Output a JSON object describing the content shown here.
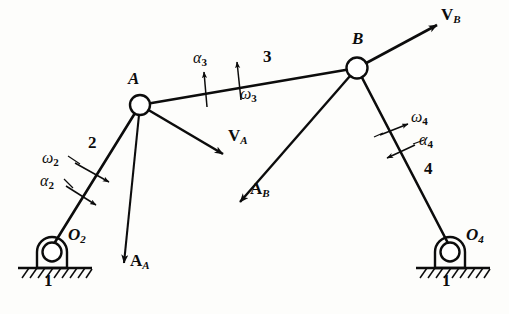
{
  "figure": {
    "type": "four-bar-linkage-kinematic-diagram",
    "background_color": "#fdfdfb",
    "ink_color": "#0c0c0c",
    "width": 509,
    "height": 314
  },
  "joints": [
    {
      "id": "A",
      "label": "A",
      "x": 140,
      "y": 105,
      "kind": "pin-joint",
      "label_x": 128,
      "label_y": 78
    },
    {
      "id": "B",
      "label": "B",
      "x": 357,
      "y": 68,
      "kind": "pin-joint",
      "label_x": 352,
      "label_y": 38
    },
    {
      "id": "O2",
      "label": "O",
      "sub": "2",
      "x": 52,
      "y": 253,
      "kind": "ground-pivot",
      "label_x": 68,
      "label_y": 234
    },
    {
      "id": "O4",
      "label": "O",
      "sub": "4",
      "x": 450,
      "y": 253,
      "kind": "ground-pivot",
      "label_x": 466,
      "label_y": 234
    }
  ],
  "links": [
    {
      "id": "link1-left",
      "number": "1",
      "label_x": 46,
      "label_y": 278,
      "role": "ground-frame"
    },
    {
      "id": "link1-right",
      "number": "1",
      "label_x": 444,
      "label_y": 278,
      "role": "ground-frame"
    },
    {
      "id": "link2",
      "number": "2",
      "label_x": 88,
      "label_y": 142,
      "role": "crank",
      "from": "O2",
      "to": "A"
    },
    {
      "id": "link3",
      "number": "3",
      "label_x": 263,
      "label_y": 57,
      "role": "coupler",
      "from": "A",
      "to": "B"
    },
    {
      "id": "link4",
      "number": "4",
      "label_x": 424,
      "label_y": 168,
      "role": "rocker",
      "from": "O4",
      "to": "B"
    }
  ],
  "vectors": [
    {
      "id": "VA",
      "symbol": "V",
      "sub": "A",
      "from_joint": "A",
      "x1": 140,
      "y1": 105,
      "x2": 223,
      "y2": 154,
      "label_x": 228,
      "label_y": 135,
      "quantity": "velocity"
    },
    {
      "id": "VB",
      "symbol": "V",
      "sub": "B",
      "from_joint": "B",
      "x1": 357,
      "y1": 68,
      "x2": 437,
      "y2": 25,
      "label_x": 441,
      "label_y": 13,
      "quantity": "velocity"
    },
    {
      "id": "AA",
      "symbol": "A",
      "sub": "A",
      "from_joint": "A",
      "x1": 140,
      "y1": 105,
      "x2": 124,
      "y2": 263,
      "label_x": 128,
      "label_y": 257,
      "quantity": "acceleration"
    },
    {
      "id": "AB",
      "symbol": "A",
      "sub": "B",
      "from_joint": "B",
      "x1": 357,
      "y1": 68,
      "x2": 240,
      "y2": 202,
      "label_x": 250,
      "label_y": 187,
      "quantity": "acceleration"
    }
  ],
  "kinematic_symbols": [
    {
      "id": "omega2",
      "symbol": "ω",
      "sub": "2",
      "label_x": 46,
      "label_y": 159,
      "quantity": "angular-velocity",
      "link": "2",
      "arrow_sense": "down-right"
    },
    {
      "id": "alpha2",
      "symbol": "α",
      "sub": "2",
      "label_x": 42,
      "label_y": 182,
      "quantity": "angular-acceleration",
      "link": "2",
      "arrow_sense": "down-right"
    },
    {
      "id": "alpha3",
      "symbol": "α",
      "sub": "3",
      "label_x": 196,
      "label_y": 58,
      "quantity": "angular-acceleration",
      "link": "3",
      "arrow_sense": "up"
    },
    {
      "id": "omega3",
      "symbol": "ω",
      "sub": "3",
      "label_x": 243,
      "label_y": 93,
      "quantity": "angular-velocity",
      "link": "3",
      "arrow_sense": "up"
    },
    {
      "id": "omega4",
      "symbol": "ω",
      "sub": "4",
      "label_x": 410,
      "label_y": 116,
      "quantity": "angular-velocity",
      "link": "4",
      "arrow_sense": "up-right"
    },
    {
      "id": "alpha4",
      "symbol": "α",
      "sub": "4",
      "label_x": 418,
      "label_y": 140,
      "quantity": "angular-acceleration",
      "link": "4",
      "arrow_sense": "down-left"
    }
  ],
  "ground": {
    "left": {
      "line_x1": 18,
      "line_x2": 92,
      "line_y": 268,
      "hatch_count": 9
    },
    "right": {
      "line_x1": 416,
      "line_x2": 490,
      "line_y": 268,
      "hatch_count": 9
    }
  }
}
